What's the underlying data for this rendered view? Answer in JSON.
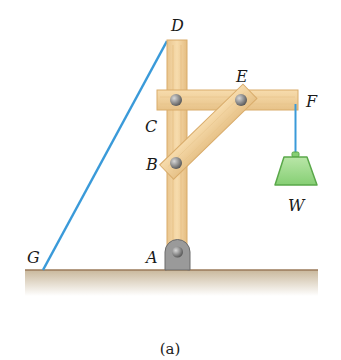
{
  "figure": {
    "caption": "(a)",
    "labels": {
      "A": "A",
      "B": "B",
      "C": "C",
      "D": "D",
      "E": "E",
      "F": "F",
      "G": "G",
      "W": "W"
    },
    "colors": {
      "wood": "#f3d19c",
      "wood_edge": "#d9ac6b",
      "cable": "#3a9ad9",
      "weight_fill": "#9ed98c",
      "weight_edge": "#5aa84a",
      "ground": "#cdbfa7",
      "ground_edge": "#9a7a5a",
      "pin": "#8a8a8a",
      "support": "#9a9a9a"
    }
  }
}
